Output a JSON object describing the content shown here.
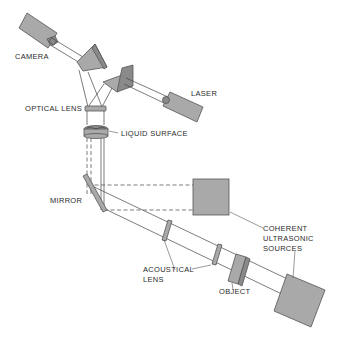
{
  "diagram": {
    "labels": {
      "camera": "CAMERA",
      "laser": "LASER",
      "optical_lens": "OPTICAL LENS",
      "liquid_surface": "LIQUID SURFACE",
      "mirror": "MIRROR",
      "coherent_line1": "COHERENT",
      "coherent_line2": "ULTRASONIC",
      "coherent_line3": "SOURCES",
      "acoustical_line1": "ACOUSTICAL",
      "acoustical_line2": "LENS",
      "object": "OBJECT"
    },
    "colors": {
      "component_fill": "#a9a9a9",
      "outline": "#555555",
      "text": "#2b2b2b",
      "background": "#ffffff"
    }
  }
}
